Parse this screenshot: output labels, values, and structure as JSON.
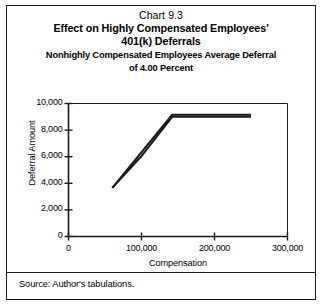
{
  "figure": {
    "chart_number": "Chart 9.3",
    "title_line1": "Effect on Highly Compensated Employees'",
    "title_line2": "401(k) Deferrals",
    "subtitle_line1": "Nonhighly Compensated Employees Average Deferral",
    "subtitle_line2": "of 4.00 Percent",
    "source": "Source: Author's tabulations."
  },
  "chart_data": {
    "type": "line",
    "title": "Chart 9.3 Effect on Highly Compensated Employees' 401(k) Deferrals",
    "subtitle": "Nonhighly Compensated Employees Average Deferral of 4.00 Percent",
    "xlabel": "Compensation",
    "ylabel": "Deferral Amount",
    "xlim": [
      0,
      300000
    ],
    "ylim": [
      0,
      10000
    ],
    "xticks": [
      0,
      100000,
      200000,
      300000
    ],
    "xtick_labels": [
      "0",
      "100,000",
      "200,000",
      "300,000"
    ],
    "yticks": [
      0,
      2000,
      4000,
      6000,
      8000,
      10000
    ],
    "ytick_labels": [
      "0",
      "2,000",
      "4,000",
      "6,000",
      "8,000",
      "10,000"
    ],
    "grid": false,
    "legend": "none",
    "series": [
      {
        "name": "Deferral limit line A",
        "color": "#1a1a1a",
        "x": [
          60000,
          142000,
          250000
        ],
        "y": [
          3650,
          9150,
          9150
        ]
      },
      {
        "name": "Deferral limit line B",
        "color": "#1a1a1a",
        "x": [
          60000,
          100000,
          142000,
          250000
        ],
        "y": [
          3650,
          6050,
          9000,
          9000
        ]
      }
    ]
  }
}
